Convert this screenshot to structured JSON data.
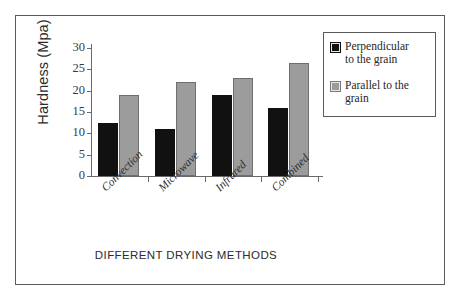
{
  "chart_data": {
    "type": "bar",
    "title": "",
    "xlabel": "DIFFERENT DRYING METHODS",
    "ylabel": "Hardness (Mpa)",
    "categories": [
      "Convection",
      "Microwave",
      "Infrared",
      "Combined"
    ],
    "series": [
      {
        "name": "Perpendicular to the grain",
        "color": "#111111",
        "values": [
          12.5,
          11,
          19,
          16
        ]
      },
      {
        "name": "Parallel to  the grain",
        "color": "#9c9c9c",
        "values": [
          19,
          22,
          23,
          26.5
        ]
      }
    ],
    "ylim": [
      0,
      30
    ],
    "ytick_labels": [
      "30",
      "25",
      "20",
      "15",
      "10",
      "5",
      "0"
    ],
    "ytick_values": [
      30,
      25,
      20,
      15,
      10,
      5,
      0
    ],
    "ytick_step": 5,
    "grid": false,
    "legend_position": "top-right",
    "xtick_label_rotation": -45
  },
  "legend": {
    "entries": [
      {
        "label_line1": "Perpendicular",
        "label_line2": "to the grain",
        "swatch": "black-square-icon"
      },
      {
        "label_line1": "Parallel to  the",
        "label_line2": "grain",
        "swatch": "gray-square-icon"
      }
    ]
  }
}
